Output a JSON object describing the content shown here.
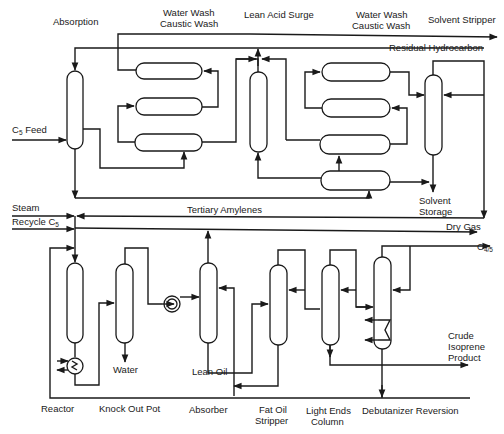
{
  "diagram": {
    "type": "process-flow",
    "top_section": {
      "labels": {
        "absorption": "Absorption",
        "water_wash_1_line1": "Water Wash",
        "water_wash_1_line2": "Caustic Wash",
        "lean_acid_surge": "Lean Acid Surge",
        "water_wash_2_line1": "Water Wash",
        "water_wash_2_line2": "Caustic Wash",
        "solvent_stripper": "Solvent Stripper",
        "residual_hydrocarbon": "Residual Hydrocarbon",
        "c5_feed_main": "C",
        "c5_feed_sub": "5",
        "c5_feed_suffix": " Feed",
        "solvent_storage_line1": "Solvent",
        "solvent_storage_line2": "Storage",
        "tertiary_amylenes": "Tertiary Amylenes"
      }
    },
    "bottom_section": {
      "labels": {
        "steam": "Steam",
        "recycle_c5_main": "Recycle C",
        "recycle_c5_sub": "5",
        "dry_gas": "Dry Gas",
        "c45_main": "C",
        "c45_sub": "4/5",
        "water": "Water",
        "lean_oil": "Lean Oil",
        "crude_isoprene_line1": "Crude",
        "crude_isoprene_line2": "Isoprene",
        "crude_isoprene_line3": "Product",
        "reactor": "Reactor",
        "knock_out_pot": "Knock Out Pot",
        "absorber": "Absorber",
        "fat_oil_stripper_line1": "Fat Oil",
        "fat_oil_stripper_line2": "Stripper",
        "light_ends_line1": "Light Ends",
        "light_ends_line2": "Column",
        "debutanizer": "Debutanizer Reversion"
      }
    }
  }
}
